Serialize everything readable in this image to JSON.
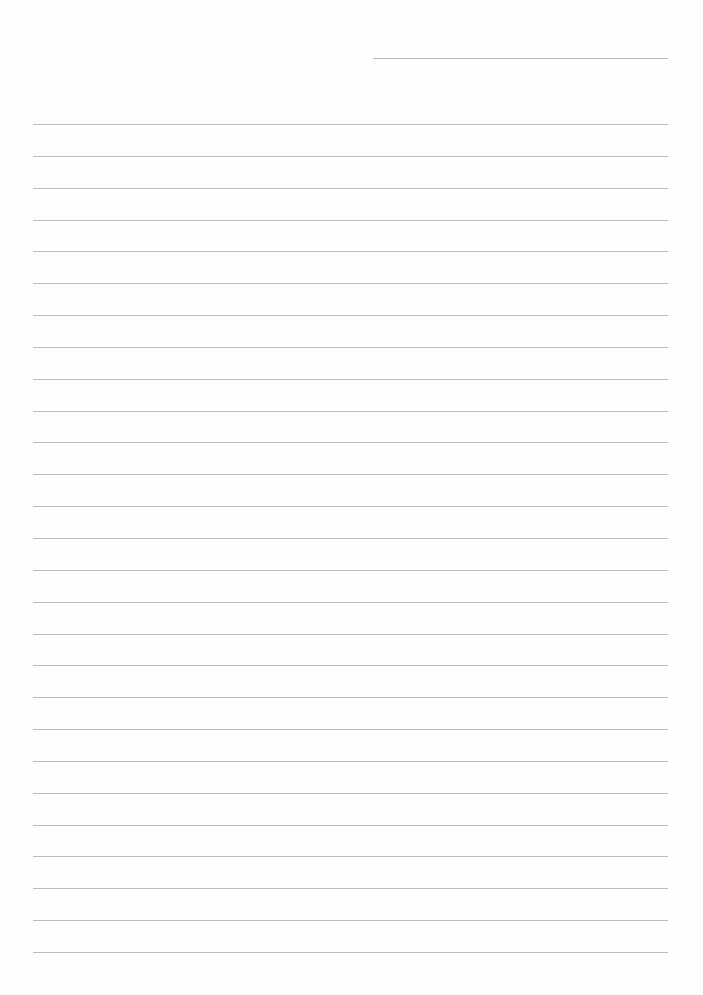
{
  "document": {
    "type": "lined-paper",
    "header_line": {
      "present": true,
      "label": ""
    },
    "ruled_lines": {
      "count": 27,
      "color": "#bdbdbd"
    },
    "background_color": "#fefefe",
    "text": []
  }
}
